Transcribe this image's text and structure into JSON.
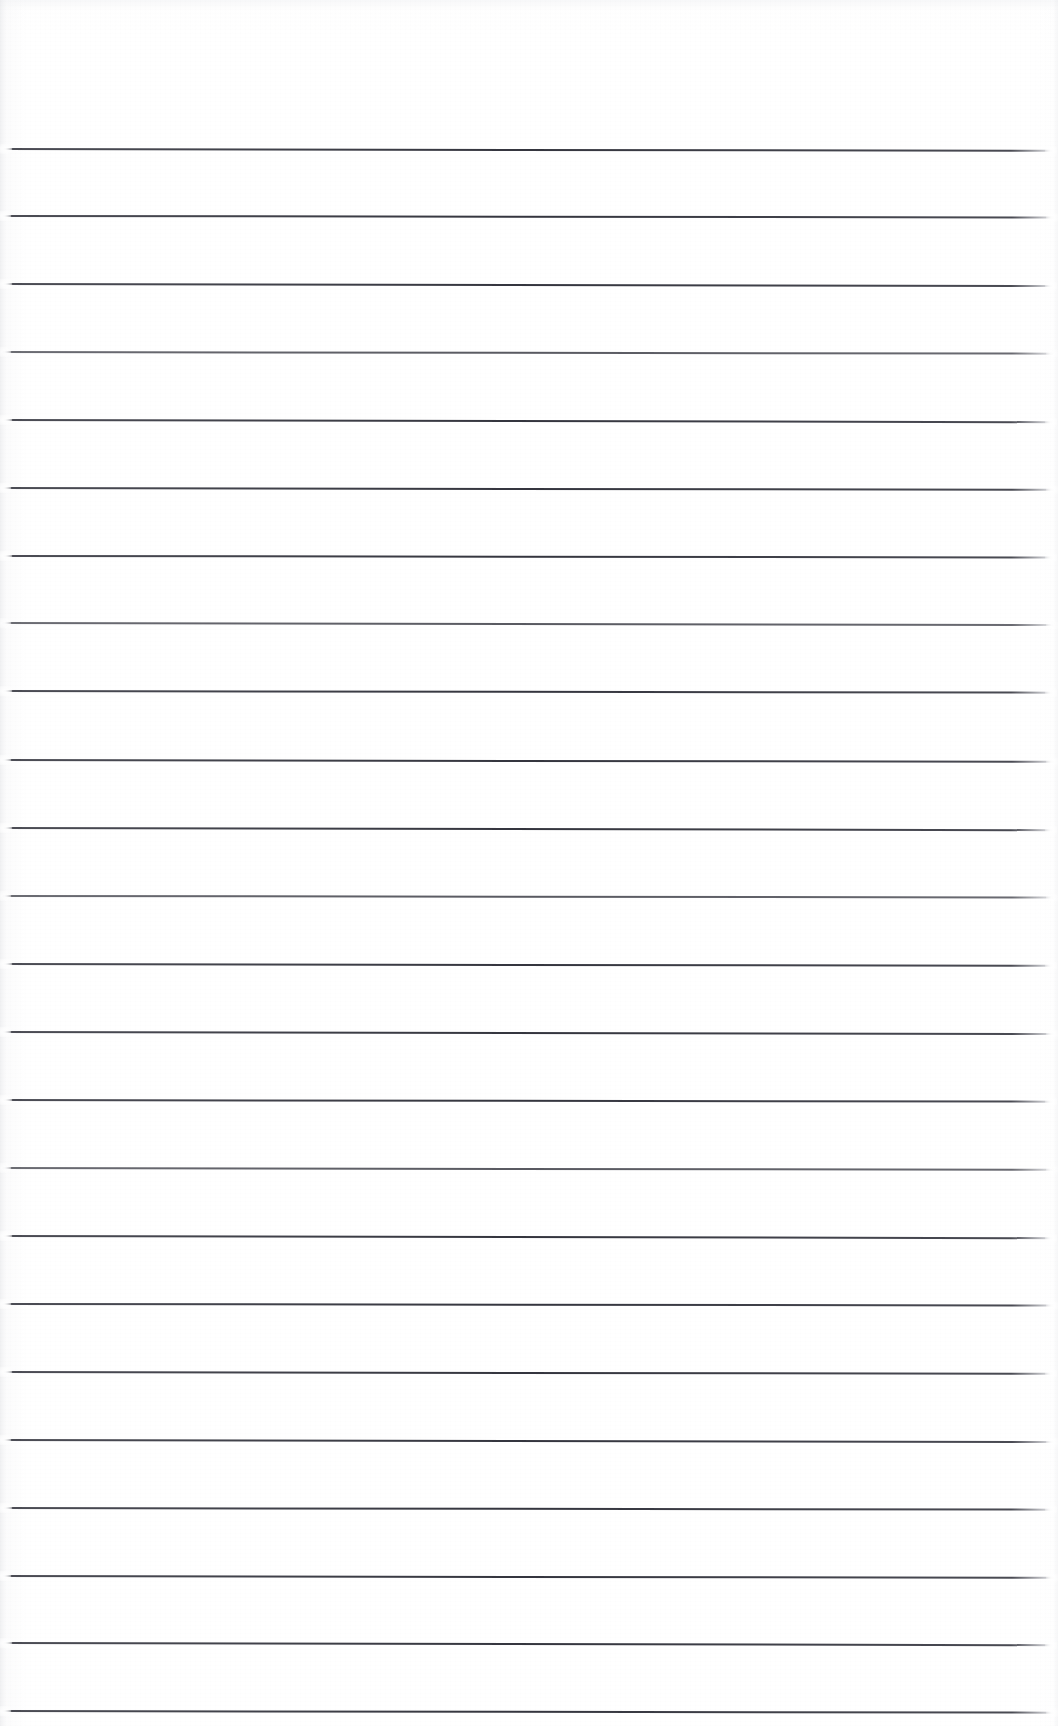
{
  "document": {
    "kind": "scanned-lined-paper",
    "page_label": "",
    "width_px": 1058,
    "height_px": 1726,
    "background_color": "#ffffff",
    "rule_color": "#34353e",
    "content_text": "",
    "notes_written": []
  },
  "ruling": {
    "line_count": 24,
    "top_margin_px": 149,
    "line_spacing_px": 67.9,
    "line_thickness_px": 2,
    "line_start_x_px": 2,
    "line_end_x_px": 1054,
    "lines": [
      {
        "index": 1,
        "y": 149,
        "x_start": 3,
        "x_end": 1053,
        "tilt_deg": 0.1,
        "weight": "strong"
      },
      {
        "index": 2,
        "y": 216,
        "x_start": 2,
        "x_end": 1054,
        "tilt_deg": 0.08,
        "weight": "strong"
      },
      {
        "index": 3,
        "y": 284,
        "x_start": 3,
        "x_end": 1053,
        "tilt_deg": 0.11,
        "weight": "strong"
      },
      {
        "index": 4,
        "y": 352,
        "x_start": 2,
        "x_end": 1054,
        "tilt_deg": 0.09,
        "weight": "faint"
      },
      {
        "index": 5,
        "y": 420,
        "x_start": 3,
        "x_end": 1053,
        "tilt_deg": 0.12,
        "weight": "strong"
      },
      {
        "index": 6,
        "y": 488,
        "x_start": 2,
        "x_end": 1054,
        "tilt_deg": 0.1,
        "weight": "strong"
      },
      {
        "index": 7,
        "y": 556,
        "x_start": 3,
        "x_end": 1053,
        "tilt_deg": 0.08,
        "weight": "strong"
      },
      {
        "index": 8,
        "y": 623,
        "x_start": 2,
        "x_end": 1054,
        "tilt_deg": 0.11,
        "weight": "faint"
      },
      {
        "index": 9,
        "y": 691,
        "x_start": 3,
        "x_end": 1053,
        "tilt_deg": 0.09,
        "weight": "strong"
      },
      {
        "index": 10,
        "y": 760,
        "x_start": 2,
        "x_end": 1054,
        "tilt_deg": 0.1,
        "weight": "strong"
      },
      {
        "index": 11,
        "y": 828,
        "x_start": 3,
        "x_end": 1053,
        "tilt_deg": 0.12,
        "weight": "strong"
      },
      {
        "index": 12,
        "y": 896,
        "x_start": 2,
        "x_end": 1054,
        "tilt_deg": 0.08,
        "weight": "faint"
      },
      {
        "index": 13,
        "y": 964,
        "x_start": 3,
        "x_end": 1053,
        "tilt_deg": 0.1,
        "weight": "strong"
      },
      {
        "index": 14,
        "y": 1032,
        "x_start": 2,
        "x_end": 1054,
        "tilt_deg": 0.11,
        "weight": "strong"
      },
      {
        "index": 15,
        "y": 1100,
        "x_start": 3,
        "x_end": 1053,
        "tilt_deg": 0.09,
        "weight": "strong"
      },
      {
        "index": 16,
        "y": 1168,
        "x_start": 2,
        "x_end": 1054,
        "tilt_deg": 0.1,
        "weight": "faint"
      },
      {
        "index": 17,
        "y": 1236,
        "x_start": 3,
        "x_end": 1053,
        "tilt_deg": 0.12,
        "weight": "strong"
      },
      {
        "index": 18,
        "y": 1304,
        "x_start": 2,
        "x_end": 1054,
        "tilt_deg": 0.08,
        "weight": "strong"
      },
      {
        "index": 19,
        "y": 1372,
        "x_start": 3,
        "x_end": 1053,
        "tilt_deg": 0.1,
        "weight": "strong"
      },
      {
        "index": 20,
        "y": 1440,
        "x_start": 2,
        "x_end": 1054,
        "tilt_deg": 0.11,
        "weight": "strong"
      },
      {
        "index": 21,
        "y": 1508,
        "x_start": 3,
        "x_end": 1053,
        "tilt_deg": 0.09,
        "weight": "strong"
      },
      {
        "index": 22,
        "y": 1576,
        "x_start": 2,
        "x_end": 1054,
        "tilt_deg": 0.1,
        "weight": "strong"
      },
      {
        "index": 23,
        "y": 1643,
        "x_start": 3,
        "x_end": 1053,
        "tilt_deg": 0.12,
        "weight": "strong"
      },
      {
        "index": 24,
        "y": 1711,
        "x_start": 2,
        "x_end": 1054,
        "tilt_deg": 0.09,
        "weight": "strong"
      }
    ]
  }
}
